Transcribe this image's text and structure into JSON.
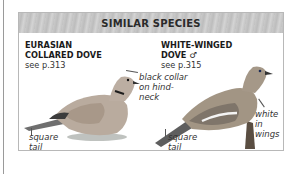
{
  "panel": {
    "title": "SIMILAR SPECIES",
    "header_color": "#c6c6c6"
  },
  "species": [
    {
      "name_line1": "EURASIAN",
      "name_line2": "COLLARED DOVE",
      "ref": "see p.313",
      "notes": {
        "collar_line1": "black collar",
        "collar_line2": "on hind-",
        "collar_line3": "neck",
        "tail_line1": "square",
        "tail_line2": "tail"
      },
      "image": "eurasian-collared-dove-illustration"
    },
    {
      "name_line1": "WHITE-WINGED",
      "name_line2": "DOVE ♂",
      "ref": "see p.315",
      "notes": {
        "wing_line1": "white in",
        "wing_line2": "wings",
        "tail_line1": "square",
        "tail_line2": "tail"
      },
      "image": "white-winged-dove-illustration"
    }
  ]
}
